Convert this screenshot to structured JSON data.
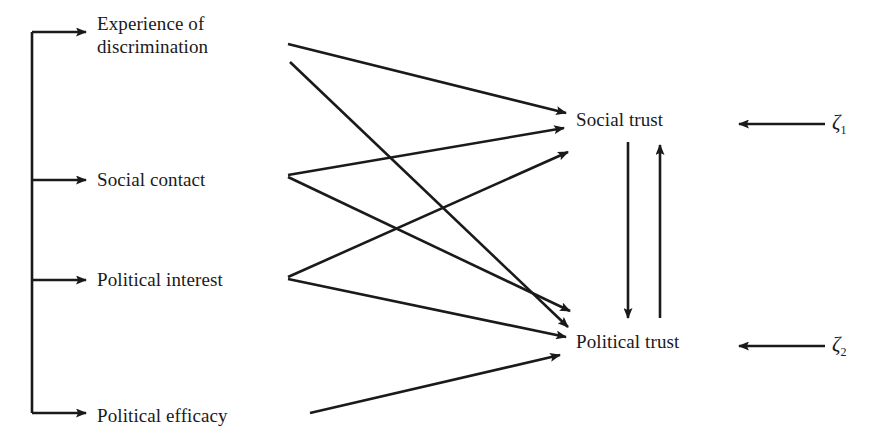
{
  "diagram": {
    "type": "path-diagram",
    "title": "",
    "stroke_color": "#1a1a1a",
    "background_color": "#ffffff",
    "exogenous_variables": [
      {
        "id": "experience-of-discrimination",
        "line1": "Experience of",
        "line2": "discrimination",
        "x": 97,
        "y": 12
      },
      {
        "id": "social-contact",
        "line1": "Social contact",
        "line2": "",
        "x": 97,
        "y": 168
      },
      {
        "id": "political-interest",
        "line1": "Political interest",
        "line2": "",
        "x": 97,
        "y": 268
      },
      {
        "id": "political-efficacy",
        "line1": "Political efficacy",
        "line2": "",
        "x": 97,
        "y": 404
      }
    ],
    "endogenous_variables": [
      {
        "id": "social-trust",
        "label": "Social trust",
        "x": 576,
        "y": 108
      },
      {
        "id": "political-trust",
        "label": "Political trust",
        "x": 576,
        "y": 330
      }
    ],
    "disturbances": [
      {
        "id": "zeta-1",
        "symbol": "ζ",
        "subscript": "1",
        "x": 832,
        "y": 110
      },
      {
        "id": "zeta-2",
        "symbol": "ζ",
        "subscript": "2",
        "x": 832,
        "y": 332
      }
    ],
    "paths": [
      {
        "from": "experience-of-discrimination",
        "to": "social-trust"
      },
      {
        "from": "experience-of-discrimination",
        "to": "political-trust"
      },
      {
        "from": "social-contact",
        "to": "social-trust"
      },
      {
        "from": "social-contact",
        "to": "political-trust"
      },
      {
        "from": "political-interest",
        "to": "social-trust"
      },
      {
        "from": "political-interest",
        "to": "political-trust"
      },
      {
        "from": "political-efficacy",
        "to": "political-trust"
      },
      {
        "from": "social-trust",
        "to": "political-trust"
      },
      {
        "from": "political-trust",
        "to": "social-trust"
      },
      {
        "from": "zeta-1",
        "to": "social-trust"
      },
      {
        "from": "zeta-2",
        "to": "political-trust"
      }
    ]
  }
}
